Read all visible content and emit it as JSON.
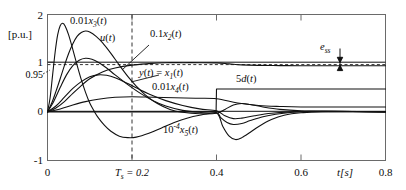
{
  "chart_data": {
    "type": "line",
    "title": "",
    "xlabel": "t[s]",
    "ylabel": "[p.u.]",
    "xlim": [
      0,
      0.8
    ],
    "ylim": [
      -1,
      2
    ],
    "grid": false,
    "legend": "inline-annotations",
    "xticks": [
      0,
      0.2,
      0.4,
      0.6,
      0.8
    ],
    "xticklabels": [
      "0",
      "Ts = 0.2",
      "0.4",
      "0.6",
      "0.8"
    ],
    "yticks": [
      2,
      1,
      0.95,
      0,
      -1
    ],
    "yticklabels": [
      "2",
      "1",
      "0.95",
      "0",
      "-1"
    ],
    "reference_lines": [
      {
        "name": "unity-reference",
        "y": 1,
        "style": "solid"
      },
      {
        "name": "tolerance-band",
        "y": 0.95,
        "style": "dashed"
      },
      {
        "name": "settling-time-marker",
        "x": 0.2,
        "style": "dashed"
      }
    ],
    "annotations": [
      {
        "name": "settling-error",
        "text": "ess",
        "x": 0.66,
        "y": 1.33
      },
      {
        "name": "settling-time",
        "text": "Ts = 0.2",
        "x": 0.2,
        "y": -1.2
      }
    ],
    "series": [
      {
        "name": "0.01x3(t)",
        "label": "0.01x3(t)",
        "label_x": 0.105,
        "label_y": 1.82,
        "points": [
          [
            0,
            0
          ],
          [
            0.006,
            0.28
          ],
          [
            0.012,
            0.75
          ],
          [
            0.018,
            1.22
          ],
          [
            0.024,
            1.58
          ],
          [
            0.03,
            1.77
          ],
          [
            0.036,
            1.82
          ],
          [
            0.042,
            1.76
          ],
          [
            0.05,
            1.58
          ],
          [
            0.06,
            1.28
          ],
          [
            0.07,
            0.96
          ],
          [
            0.08,
            0.66
          ],
          [
            0.09,
            0.4
          ],
          [
            0.1,
            0.18
          ],
          [
            0.11,
            0.02
          ],
          [
            0.12,
            -0.12
          ],
          [
            0.135,
            -0.28
          ],
          [
            0.15,
            -0.4
          ],
          [
            0.17,
            -0.5
          ],
          [
            0.19,
            -0.53
          ],
          [
            0.21,
            -0.52
          ],
          [
            0.24,
            -0.44
          ],
          [
            0.27,
            -0.33
          ],
          [
            0.3,
            -0.22
          ],
          [
            0.33,
            -0.13
          ],
          [
            0.36,
            -0.07
          ],
          [
            0.4,
            -0.02
          ],
          [
            0.41,
            -0.12
          ],
          [
            0.425,
            -0.22
          ],
          [
            0.44,
            -0.26
          ],
          [
            0.46,
            -0.24
          ],
          [
            0.48,
            -0.18
          ],
          [
            0.51,
            -0.1
          ],
          [
            0.54,
            -0.05
          ],
          [
            0.58,
            -0.01
          ],
          [
            0.62,
            0.01
          ],
          [
            0.68,
            0.01
          ],
          [
            0.8,
            0.0
          ]
        ]
      },
      {
        "name": "u(t)",
        "label": "u(t)",
        "label_x": 0.205,
        "label_y": 1.62,
        "points": [
          [
            0,
            0
          ],
          [
            0.01,
            0.18
          ],
          [
            0.02,
            0.42
          ],
          [
            0.03,
            0.68
          ],
          [
            0.04,
            0.95
          ],
          [
            0.05,
            1.2
          ],
          [
            0.06,
            1.4
          ],
          [
            0.07,
            1.55
          ],
          [
            0.08,
            1.63
          ],
          [
            0.09,
            1.66
          ],
          [
            0.1,
            1.64
          ],
          [
            0.115,
            1.55
          ],
          [
            0.13,
            1.42
          ],
          [
            0.15,
            1.2
          ],
          [
            0.17,
            0.96
          ],
          [
            0.19,
            0.73
          ],
          [
            0.21,
            0.53
          ],
          [
            0.23,
            0.36
          ],
          [
            0.26,
            0.17
          ],
          [
            0.29,
            0.05
          ],
          [
            0.32,
            -0.01
          ],
          [
            0.36,
            -0.04
          ],
          [
            0.4,
            -0.03
          ],
          [
            0.42,
            0.05
          ],
          [
            0.44,
            0.14
          ],
          [
            0.46,
            0.17
          ],
          [
            0.48,
            0.15
          ],
          [
            0.51,
            0.1
          ],
          [
            0.55,
            0.05
          ],
          [
            0.6,
            0.02
          ],
          [
            0.66,
            0.01
          ],
          [
            0.8,
            0.0
          ]
        ]
      },
      {
        "name": "0.1x2(t)",
        "label": "0.1x2(t)",
        "label_x": 0.4,
        "label_y": 1.62,
        "points": [
          [
            0,
            0
          ],
          [
            0.015,
            0.22
          ],
          [
            0.03,
            0.5
          ],
          [
            0.045,
            0.76
          ],
          [
            0.06,
            0.95
          ],
          [
            0.075,
            1.06
          ],
          [
            0.09,
            1.1
          ],
          [
            0.105,
            1.08
          ],
          [
            0.12,
            1.02
          ],
          [
            0.14,
            0.9
          ],
          [
            0.16,
            0.76
          ],
          [
            0.19,
            0.56
          ],
          [
            0.22,
            0.38
          ],
          [
            0.25,
            0.23
          ],
          [
            0.28,
            0.12
          ],
          [
            0.32,
            0.03
          ],
          [
            0.36,
            -0.01
          ],
          [
            0.4,
            -0.02
          ],
          [
            0.415,
            -0.3
          ],
          [
            0.43,
            -0.5
          ],
          [
            0.445,
            -0.57
          ],
          [
            0.46,
            -0.53
          ],
          [
            0.48,
            -0.42
          ],
          [
            0.5,
            -0.3
          ],
          [
            0.53,
            -0.16
          ],
          [
            0.56,
            -0.07
          ],
          [
            0.6,
            -0.02
          ],
          [
            0.65,
            0.0
          ],
          [
            0.8,
            0.0
          ]
        ]
      },
      {
        "name": "y(t)=x1(t)",
        "label": "y(t) = x1(t)",
        "label_x": 0.345,
        "label_y": 0.72,
        "points": [
          [
            0,
            0
          ],
          [
            0.02,
            0.08
          ],
          [
            0.04,
            0.21
          ],
          [
            0.06,
            0.38
          ],
          [
            0.08,
            0.54
          ],
          [
            0.1,
            0.68
          ],
          [
            0.13,
            0.82
          ],
          [
            0.16,
            0.9
          ],
          [
            0.2,
            0.96
          ],
          [
            0.24,
            0.99
          ],
          [
            0.28,
            1.01
          ],
          [
            0.32,
            1.01
          ],
          [
            0.36,
            1.01
          ],
          [
            0.4,
            1.005
          ],
          [
            0.43,
            0.985
          ],
          [
            0.46,
            0.965
          ],
          [
            0.5,
            0.955
          ],
          [
            0.55,
            0.95
          ],
          [
            0.6,
            0.948
          ],
          [
            0.7,
            0.947
          ],
          [
            0.8,
            0.947
          ]
        ]
      },
      {
        "name": "0.01x4(t)",
        "label": "0.01x4(t)",
        "label_x": 0.415,
        "label_y": 0.46,
        "points": [
          [
            0,
            0
          ],
          [
            0.02,
            0.12
          ],
          [
            0.04,
            0.3
          ],
          [
            0.06,
            0.48
          ],
          [
            0.08,
            0.62
          ],
          [
            0.1,
            0.72
          ],
          [
            0.12,
            0.76
          ],
          [
            0.14,
            0.75
          ],
          [
            0.16,
            0.7
          ],
          [
            0.19,
            0.58
          ],
          [
            0.22,
            0.45
          ],
          [
            0.25,
            0.33
          ],
          [
            0.28,
            0.23
          ],
          [
            0.32,
            0.13
          ],
          [
            0.36,
            0.06
          ],
          [
            0.4,
            0.02
          ],
          [
            0.42,
            -0.08
          ],
          [
            0.44,
            -0.14
          ],
          [
            0.46,
            -0.13
          ],
          [
            0.49,
            -0.08
          ],
          [
            0.53,
            -0.03
          ],
          [
            0.58,
            0.0
          ],
          [
            0.65,
            0.01
          ],
          [
            0.8,
            0.0
          ]
        ]
      },
      {
        "name": "1e-4 x5(t)",
        "label": "10-4x5(t)",
        "label_x": 0.345,
        "label_y": -0.3,
        "points": [
          [
            0,
            0
          ],
          [
            0.03,
            0.06
          ],
          [
            0.06,
            0.14
          ],
          [
            0.09,
            0.21
          ],
          [
            0.12,
            0.26
          ],
          [
            0.16,
            0.3
          ],
          [
            0.2,
            0.31
          ],
          [
            0.25,
            0.3
          ],
          [
            0.3,
            0.29
          ],
          [
            0.35,
            0.28
          ],
          [
            0.4,
            0.27
          ],
          [
            0.45,
            0.18
          ],
          [
            0.5,
            0.13
          ],
          [
            0.55,
            0.11
          ],
          [
            0.6,
            0.1
          ],
          [
            0.7,
            0.1
          ],
          [
            0.8,
            0.1
          ]
        ]
      },
      {
        "name": "5d(t)",
        "label": "5d(t)",
        "label_x": 0.455,
        "label_y": 0.56,
        "points": [
          [
            0,
            0
          ],
          [
            0.399,
            0
          ],
          [
            0.4,
            0.47
          ],
          [
            0.8,
            0.47
          ]
        ]
      }
    ]
  },
  "axes": {
    "y_unit": "[p.u.]",
    "x_unit": "t[s]"
  },
  "colors": {
    "line": "#111111",
    "frame": "#555555",
    "dashed": "#333333",
    "background": "#ffffff"
  }
}
